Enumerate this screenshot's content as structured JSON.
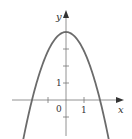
{
  "chart_data": {
    "type": "line",
    "title": "",
    "function": "y = 4 - x^2",
    "xlabel": "x",
    "ylabel": "y",
    "x_tick_labels": [
      "0",
      "1"
    ],
    "y_tick_labels": [
      "1"
    ],
    "x_ticks": [
      -1,
      1
    ],
    "y_ticks": [
      -1,
      1,
      2,
      3
    ],
    "xlim": [
      -3.8,
      3.3
    ],
    "ylim": [
      -2.2,
      5.5
    ],
    "grid": false,
    "series": [
      {
        "name": "parabola",
        "x": [
          -2.5,
          -2,
          -1.5,
          -1,
          -0.5,
          0,
          0.5,
          1,
          1.5,
          2,
          2.5
        ],
        "values": [
          -2.25,
          0,
          1.75,
          3,
          3.75,
          4,
          3.75,
          3,
          1.75,
          0,
          -2.25
        ],
        "color": "#6b6b6b"
      }
    ]
  },
  "labels": {
    "x_axis": "x",
    "y_axis": "y",
    "origin": "0",
    "x_one": "1",
    "y_one": "1"
  }
}
